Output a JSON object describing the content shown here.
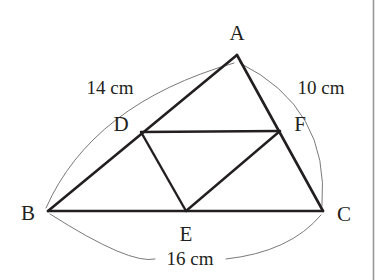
{
  "figure": {
    "kind": "geometry-diagram",
    "background_color": "#ffffff",
    "stroke_color": "#231f20",
    "arc_color": "#6d6a68",
    "rule_color": "#9a9897"
  },
  "vertices": {
    "A": {
      "label": "A",
      "x": 237,
      "y": 55,
      "label_x": 237,
      "label_y": 35
    },
    "B": {
      "label": "B",
      "x": 48,
      "y": 211,
      "label_x": 28,
      "label_y": 215
    },
    "C": {
      "label": "C",
      "x": 323,
      "y": 211,
      "label_x": 344,
      "label_y": 216
    },
    "D": {
      "label": "D",
      "x": 141,
      "y": 132,
      "label_x": 121,
      "label_y": 126
    },
    "E": {
      "label": "E",
      "x": 186,
      "y": 211,
      "label_x": 186,
      "label_y": 236
    },
    "F": {
      "label": "F",
      "x": 280,
      "y": 131,
      "label_x": 300,
      "label_y": 126
    }
  },
  "edges": [
    {
      "name": "side-AB",
      "from": "A",
      "to": "B",
      "kind": "outer"
    },
    {
      "name": "side-AC",
      "from": "A",
      "to": "C",
      "kind": "outer"
    },
    {
      "name": "side-BC",
      "from": "B",
      "to": "C",
      "kind": "outer"
    },
    {
      "name": "segment-DF",
      "from": "D",
      "to": "F",
      "kind": "median"
    },
    {
      "name": "segment-DE",
      "from": "D",
      "to": "E",
      "kind": "median"
    },
    {
      "name": "segment-EF",
      "from": "E",
      "to": "F",
      "kind": "median"
    }
  ],
  "dimensions": [
    {
      "name": "ab",
      "text": "14 cm",
      "side": "AB",
      "label_x": 110,
      "label_y": 90
    },
    {
      "name": "ac",
      "text": "10 cm",
      "side": "AC",
      "label_x": 321,
      "label_y": 90
    },
    {
      "name": "bc",
      "text": "16 cm",
      "side": "BC",
      "label_x": 190,
      "label_y": 261
    }
  ],
  "arcs": {
    "ab_path": "M 46 208 Q 92 104 234 63",
    "ac_path": "M 240 63 Q 330 108 322 206",
    "bc_path": "M 50 214 Q 130 265 155 259",
    "bc_path_right": "M 226 259 Q 290 252 321 215"
  },
  "right_rule": {
    "name": "page-edge-rule",
    "x": 373.5,
    "y1": 0,
    "y2": 280
  }
}
